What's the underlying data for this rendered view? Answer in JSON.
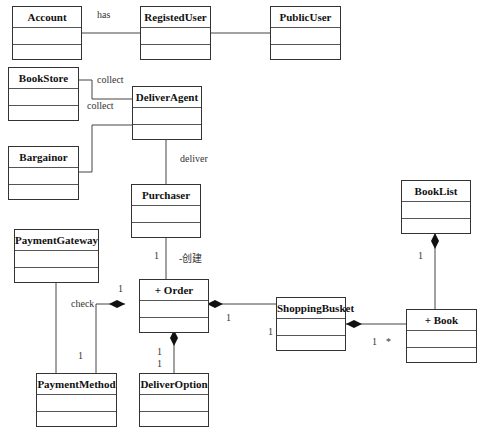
{
  "classes": {
    "account": "Account",
    "registed_user": "RegistedUser",
    "public_user": "PublicUser",
    "book_store": "BookStore",
    "deliver_agent": "DeliverAgent",
    "bargainor": "Bargainor",
    "purchaser": "Purchaser",
    "book_list": "BookList",
    "payment_gateway": "PaymentGateway",
    "order": "+ Order",
    "shopping_busket": "ShoppingBusket",
    "book": "+ Book",
    "payment_method": "PaymentMethod",
    "deliver_option": "DeliverOption"
  },
  "labels": {
    "has": "has",
    "collect1": "collect",
    "collect2": "collect",
    "deliver": "deliver",
    "create": "-创建",
    "check": "check",
    "m_purchaser_order": "1",
    "m_order_left": "1",
    "m_payment_method": "1",
    "m_order_right": "1",
    "m_busket_left": "1",
    "m_busket_book": "1",
    "m_book_star": "*",
    "m_booklist": "1",
    "m_deliver_option_a": "1",
    "m_deliver_option_b": "1"
  }
}
